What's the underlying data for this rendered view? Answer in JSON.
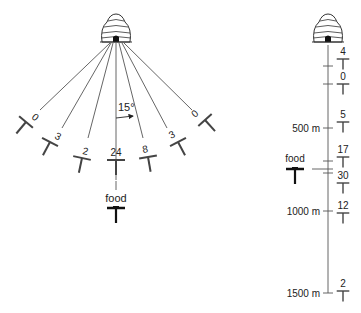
{
  "fan_experiment": {
    "angle_label": "15°",
    "food_label": "food",
    "feeders": [
      {
        "count": "0",
        "angle": -60
      },
      {
        "count": "3",
        "angle": -42
      },
      {
        "count": "2",
        "angle": -22
      },
      {
        "count": "24",
        "angle": 0
      },
      {
        "count": "8",
        "angle": 15
      },
      {
        "count": "3",
        "angle": 33
      },
      {
        "count": "0",
        "angle": 50
      }
    ]
  },
  "distance_experiment": {
    "food_label": "food",
    "scale_labels": {
      "m500": "500 m",
      "m1000": "1000 m",
      "m1500": "1500 m"
    },
    "feeders": [
      {
        "count": "4"
      },
      {
        "count": "0"
      },
      {
        "count": "5"
      },
      {
        "count": "17"
      },
      {
        "count": "30"
      },
      {
        "count": "12"
      },
      {
        "count": "2"
      }
    ]
  },
  "colors": {
    "ink": "#222222",
    "line": "#555555",
    "background": "#ffffff"
  }
}
